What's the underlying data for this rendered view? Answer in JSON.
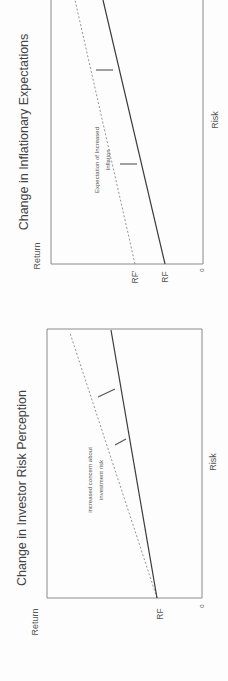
{
  "page": {
    "orientation": "rotated 90 degrees counterclockwise",
    "background": "#fdfdfd"
  },
  "diagrams": [
    {
      "id": "inflation",
      "title": "Change in Inflationary Expectations",
      "y_axis_label": "Return",
      "x_axis_label": "Risk",
      "origin_label": "0",
      "rf_labels": [
        "RF'",
        "RF"
      ],
      "annotation": [
        "Expectation of Increased",
        "Inflation"
      ],
      "geometry": {
        "frame": {
          "x1": 51,
          "y1": 0,
          "x2": 203,
          "y2": 264
        },
        "solid_line": {
          "x1": 165,
          "y1": 264,
          "x2": 103,
          "y2": 0
        },
        "dashed_line": {
          "x1": 135,
          "y1": 264,
          "x2": 75,
          "y2": 0
        },
        "ticks": [
          {
            "x1": 96,
            "y1": 70,
            "x2": 113,
            "y2": 70
          },
          {
            "x1": 120,
            "y1": 164,
            "x2": 137,
            "y2": 164
          }
        ],
        "title_pos": {
          "x": 28,
          "y": 132
        },
        "return_pos": {
          "x": 40,
          "y": 256
        },
        "risk_pos": {
          "x": 218,
          "y": 120
        },
        "zero_pos": {
          "x": 204,
          "y": 270
        },
        "rf_pos": [
          {
            "x": 138,
            "y": 277
          },
          {
            "x": 168,
            "y": 277
          }
        ],
        "annot_pos": [
          {
            "x": 99,
            "y": 160
          },
          {
            "x": 110,
            "y": 160
          }
        ]
      }
    },
    {
      "id": "risk",
      "title": "Change in Investor Risk Perception",
      "y_axis_label": "Return",
      "x_axis_label": "Risk",
      "origin_label": "0",
      "rf_labels": [
        "RF"
      ],
      "annotation": [
        "increased concern about",
        "investment risk"
      ],
      "geometry": {
        "frame": {
          "x1": 47,
          "y1": 329,
          "x2": 202,
          "y2": 598
        },
        "solid_line": {
          "x1": 157,
          "y1": 598,
          "x2": 111,
          "y2": 330
        },
        "dashed_line": {
          "x1": 157,
          "y1": 598,
          "x2": 70,
          "y2": 333
        },
        "ticks": [
          {
            "x1": 98,
            "y1": 397,
            "x2": 115,
            "y2": 389
          },
          {
            "x1": 115,
            "y1": 445,
            "x2": 126,
            "y2": 439
          }
        ],
        "title_pos": {
          "x": 26,
          "y": 488
        },
        "return_pos": {
          "x": 38,
          "y": 622
        },
        "risk_pos": {
          "x": 216,
          "y": 462
        },
        "zero_pos": {
          "x": 204,
          "y": 606
        },
        "rf_pos": [
          {
            "x": 163,
            "y": 614
          }
        ],
        "annot_pos": [
          {
            "x": 92,
            "y": 480
          },
          {
            "x": 103,
            "y": 480
          }
        ]
      }
    }
  ],
  "chart_data": [
    {
      "type": "line",
      "title": "Change in Inflationary Expectations",
      "xlabel": "Risk",
      "ylabel": "Return",
      "series": [
        {
          "name": "Original SML (from RF)",
          "style": "solid",
          "intercept_label": "RF"
        },
        {
          "name": "Shifted SML (from RF')",
          "style": "dashed",
          "intercept_label": "RF'"
        }
      ],
      "annotations": [
        "Expectation of Increased Inflation"
      ],
      "origin": "0"
    },
    {
      "type": "line",
      "title": "Change in Investor Risk Perception",
      "xlabel": "Risk",
      "ylabel": "Return",
      "series": [
        {
          "name": "Original SML",
          "style": "solid",
          "intercept_label": "RF"
        },
        {
          "name": "Steeper SML",
          "style": "dashed",
          "intercept_label": "RF"
        }
      ],
      "annotations": [
        "increased concern about investment risk"
      ],
      "origin": "0"
    }
  ]
}
